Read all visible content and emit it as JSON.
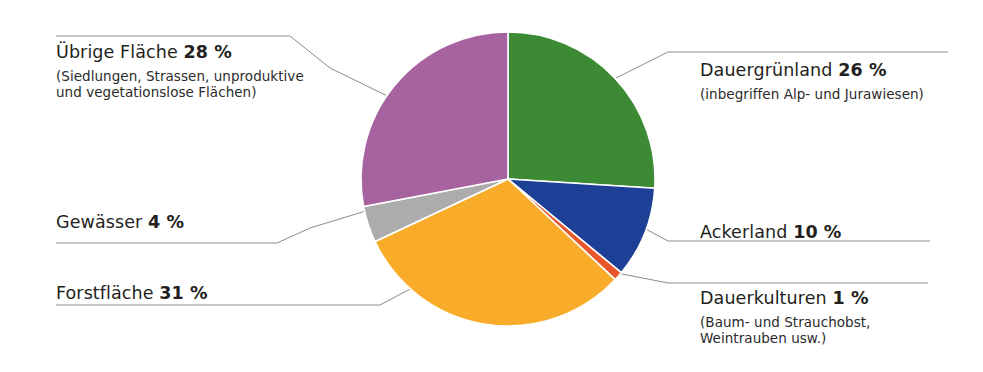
{
  "figure": {
    "background": "#ffffff",
    "width": 983,
    "height": 372
  },
  "chart_data": {
    "type": "pie",
    "title": "",
    "subtitle": "",
    "xlabel": "",
    "ylabel": "",
    "units": "%",
    "total": 100,
    "start_angle_deg": 0,
    "direction": "clockwise",
    "legend_position": "callout-labels",
    "grid": false,
    "categories": [
      "Dauergrünland",
      "Ackerland",
      "Dauerkulturen",
      "Forstfläche",
      "Gewässer",
      "Übrige Fläche"
    ],
    "values": [
      26,
      10,
      1,
      31,
      4,
      28
    ],
    "colors": [
      "#3c8a33",
      "#1d3f96",
      "#e8562a",
      "#f9ab2a",
      "#acacac",
      "#a763a0"
    ],
    "slices": [
      {
        "name": "Dauergrünland",
        "value": 26,
        "value_label": "26 %",
        "color": "#3c8a33",
        "start_deg": 0,
        "end_deg": 93.6
      },
      {
        "name": "Ackerland",
        "value": 10,
        "value_label": "10 %",
        "color": "#1d3f96",
        "start_deg": 93.6,
        "end_deg": 129.6
      },
      {
        "name": "Dauerkulturen",
        "value": 1,
        "value_label": "1 %",
        "color": "#e8562a",
        "start_deg": 129.6,
        "end_deg": 133.2
      },
      {
        "name": "Forstfläche",
        "value": 31,
        "value_label": "31 %",
        "color": "#f9ab2a",
        "start_deg": 133.2,
        "end_deg": 244.8
      },
      {
        "name": "Gewässer",
        "value": 4,
        "value_label": "4 %",
        "color": "#acacac",
        "start_deg": 244.8,
        "end_deg": 259.2
      },
      {
        "name": "Übrige Fläche",
        "value": 28,
        "value_label": "28 %",
        "color": "#a763a0",
        "start_deg": 259.2,
        "end_deg": 360
      }
    ],
    "geometry": {
      "center_x": 508,
      "center_y": 179,
      "radius": 147
    }
  },
  "labels": {
    "uebrige_flaeche": {
      "name": "Übrige Fläche",
      "value": "28 %",
      "sub_line_1": "(Siedlungen, Strassen, unproduktive",
      "sub_line_2": "und vegetationslose Flächen)"
    },
    "gewaesser": {
      "name": "Gewässer",
      "value": "4 %"
    },
    "forstflaeche": {
      "name": "Forstfläche",
      "value": "31 %"
    },
    "dauergruenland": {
      "name": "Dauergrünland",
      "value": "26 %",
      "sub_line_1": "(inbegriffen Alp- und Jurawiesen)"
    },
    "ackerland": {
      "name": "Ackerland",
      "value": "10 %"
    },
    "dauerkulturen": {
      "name": "Dauerkulturen",
      "value": "1 %",
      "sub_line_1": "(Baum- und Strauchobst,",
      "sub_line_2": "Weintrauben usw.)"
    }
  },
  "leader_lines": {
    "color": "#8c8c8c",
    "width": 1
  }
}
